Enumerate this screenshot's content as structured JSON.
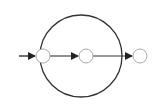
{
  "diagram": {
    "type": "state-flow",
    "colors": {
      "background": "#ffffff",
      "outer_circle": "#333333",
      "node_stroke": "#aaaaaa",
      "arrow": "#222222"
    },
    "outer_circle": {
      "cx": 81,
      "cy": 56,
      "r": 41
    },
    "nodes": [
      {
        "id": "node-1",
        "cx": 43,
        "cy": 56,
        "r": 7
      },
      {
        "id": "node-2",
        "cx": 86,
        "cy": 56,
        "r": 7
      },
      {
        "id": "node-3",
        "cx": 140,
        "cy": 56,
        "r": 7
      }
    ],
    "edges": [
      {
        "from": "entry",
        "to": "node-1"
      },
      {
        "from": "node-1",
        "to": "node-2"
      },
      {
        "from": "node-2",
        "to": "node-3"
      }
    ]
  }
}
